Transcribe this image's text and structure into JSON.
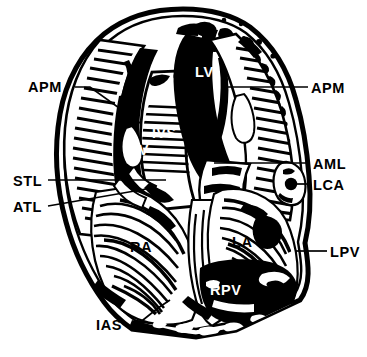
{
  "figure": {
    "style": "black-and-white anatomical line engraving",
    "background_color": "#ffffff",
    "ink_color": "#000000"
  },
  "callout_labels": [
    {
      "id": "apm-left",
      "text": "APM",
      "side": "left",
      "x": 28,
      "y": 80
    },
    {
      "id": "stl",
      "text": "STL",
      "side": "left",
      "x": 13,
      "y": 174
    },
    {
      "id": "atl",
      "text": "ATL",
      "side": "left",
      "x": 13,
      "y": 200
    },
    {
      "id": "ias",
      "text": "IAS",
      "side": "left",
      "x": 96,
      "y": 318
    },
    {
      "id": "apm-right",
      "text": "APM",
      "side": "right",
      "x": 311,
      "y": 81
    },
    {
      "id": "aml",
      "text": "AML",
      "side": "right",
      "x": 313,
      "y": 157
    },
    {
      "id": "lca",
      "text": "LCA",
      "side": "right",
      "x": 313,
      "y": 178
    },
    {
      "id": "lpv",
      "text": "LPV",
      "side": "right",
      "x": 330,
      "y": 245
    }
  ],
  "interior_labels": [
    {
      "id": "lv",
      "text": "LV",
      "color": "#ffffff",
      "x": 195,
      "y": 65
    },
    {
      "id": "ivs",
      "text": "IVS",
      "color": "#ffffff",
      "x": 152,
      "y": 126
    },
    {
      "id": "rv",
      "text": "RV",
      "color": "#ffffff",
      "x": 128,
      "y": 143
    },
    {
      "id": "ra",
      "text": "RA",
      "color": "#000000",
      "x": 130,
      "y": 240
    },
    {
      "id": "la",
      "text": "LA",
      "color": "#000000",
      "x": 232,
      "y": 235
    },
    {
      "id": "rpv",
      "text": "RPV",
      "color": "#ffffff",
      "x": 210,
      "y": 283
    }
  ],
  "legend_expansions": {
    "APM": "anterior papillary muscle",
    "STL": "septal tricuspid leaflet",
    "ATL": "anterior tricuspid leaflet",
    "IAS": "interatrial septum",
    "AML": "anterior mitral leaflet",
    "LCA": "left coronary artery",
    "LPV": "left pulmonary vein",
    "LV": "left ventricle",
    "IVS": "interventricular septum",
    "RV": "right ventricle",
    "RA": "right atrium",
    "LA": "left atrium",
    "RPV": "right pulmonary vein"
  }
}
